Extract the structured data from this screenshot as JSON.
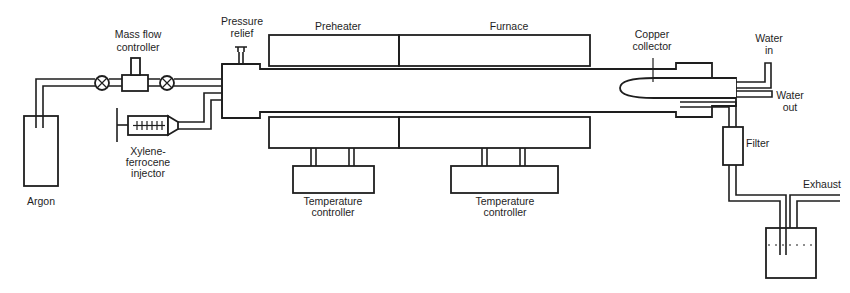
{
  "diagram": {
    "type": "apparatus-schematic",
    "labels": {
      "mass_flow_controller": [
        "Mass flow",
        "controller"
      ],
      "pressure_relief": [
        "Pressure",
        "relief"
      ],
      "preheater": "Preheater",
      "furnace": "Furnace",
      "copper_collector": [
        "Copper",
        "collector"
      ],
      "water_in": [
        "Water",
        "in"
      ],
      "water_out": [
        "Water",
        "out"
      ],
      "filter": "Filter",
      "exhaust": "Exhaust",
      "argon": "Argon",
      "injector": [
        "Xylene-",
        "ferrocene",
        "injector"
      ],
      "temp_controller_1": [
        "Temperature",
        "controller"
      ],
      "temp_controller_2": [
        "Temperature",
        "controller"
      ]
    },
    "colors": {
      "line": "#1e1e1e",
      "background": "#ffffff"
    }
  }
}
